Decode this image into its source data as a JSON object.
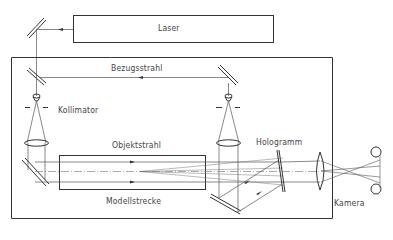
{
  "diagram": {
    "type": "optical-setup",
    "labels": {
      "laser": "Laser",
      "reference_beam": "Bezugsstrahl",
      "collimator": "Kollimator",
      "object_beam": "Objektstrahl",
      "hologram": "Hologramm",
      "test_section": "Modellstrecke",
      "camera": "Kamera"
    },
    "colors": {
      "stroke": "#333333",
      "thin_stroke": "#666666",
      "text": "#444444",
      "background": "#ffffff"
    }
  }
}
